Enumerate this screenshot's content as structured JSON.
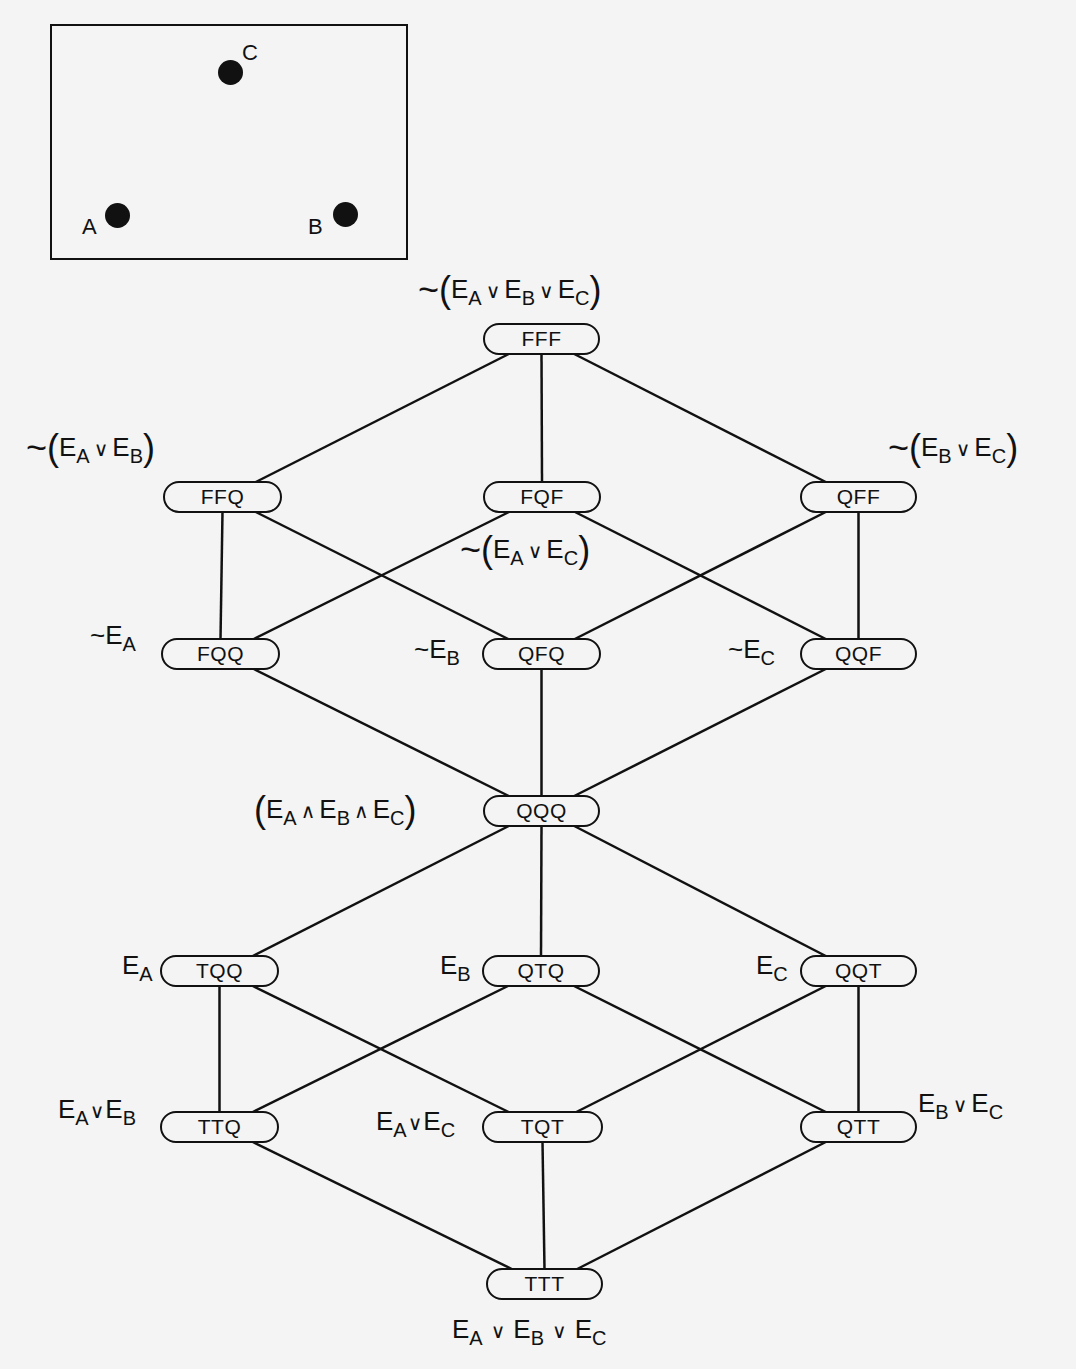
{
  "inset": {
    "points": [
      {
        "name": "A",
        "x": 117,
        "y": 215,
        "label_x": 82,
        "label_y": 214
      },
      {
        "name": "B",
        "x": 345,
        "y": 214,
        "label_x": 308,
        "label_y": 214
      },
      {
        "name": "C",
        "x": 230,
        "y": 72,
        "label_x": 242,
        "label_y": 40
      }
    ]
  },
  "nodes": [
    {
      "id": "FFF",
      "label": "FFF",
      "x": 483,
      "y": 323,
      "w": 117
    },
    {
      "id": "FFQ",
      "label": "FFQ",
      "x": 163,
      "y": 481,
      "w": 119
    },
    {
      "id": "FQF",
      "label": "FQF",
      "x": 483,
      "y": 481,
      "w": 118
    },
    {
      "id": "QFF",
      "label": "QFF",
      "x": 800,
      "y": 481,
      "w": 117
    },
    {
      "id": "FQQ",
      "label": "FQQ",
      "x": 161,
      "y": 638,
      "w": 119
    },
    {
      "id": "QFQ",
      "label": "QFQ",
      "x": 482,
      "y": 638,
      "w": 119
    },
    {
      "id": "QQF",
      "label": "QQF",
      "x": 800,
      "y": 638,
      "w": 117
    },
    {
      "id": "QQQ",
      "label": "QQQ",
      "x": 483,
      "y": 795,
      "w": 117
    },
    {
      "id": "TQQ",
      "label": "TQQ",
      "x": 160,
      "y": 955,
      "w": 119
    },
    {
      "id": "QTQ",
      "label": "QTQ",
      "x": 482,
      "y": 955,
      "w": 118
    },
    {
      "id": "QQT",
      "label": "QQT",
      "x": 800,
      "y": 955,
      "w": 117
    },
    {
      "id": "TTQ",
      "label": "TTQ",
      "x": 160,
      "y": 1111,
      "w": 119
    },
    {
      "id": "TQT",
      "label": "TQT",
      "x": 482,
      "y": 1111,
      "w": 121
    },
    {
      "id": "QTT",
      "label": "QTT",
      "x": 800,
      "y": 1111,
      "w": 117
    },
    {
      "id": "TTT",
      "label": "TTT",
      "x": 486,
      "y": 1268,
      "w": 117
    }
  ],
  "edges": [
    [
      "FFF",
      "FFQ"
    ],
    [
      "FFF",
      "FQF"
    ],
    [
      "FFF",
      "QFF"
    ],
    [
      "FFQ",
      "FQQ"
    ],
    [
      "FFQ",
      "QFQ"
    ],
    [
      "FQF",
      "FQQ"
    ],
    [
      "FQF",
      "QQF"
    ],
    [
      "QFF",
      "QFQ"
    ],
    [
      "QFF",
      "QQF"
    ],
    [
      "FQQ",
      "QQQ"
    ],
    [
      "QFQ",
      "QQQ"
    ],
    [
      "QQF",
      "QQQ"
    ],
    [
      "QQQ",
      "TQQ"
    ],
    [
      "QQQ",
      "QTQ"
    ],
    [
      "QQQ",
      "QQT"
    ],
    [
      "TQQ",
      "TTQ"
    ],
    [
      "TQQ",
      "TQT"
    ],
    [
      "QTQ",
      "TTQ"
    ],
    [
      "QTQ",
      "QTT"
    ],
    [
      "QQT",
      "TQT"
    ],
    [
      "QQT",
      "QTT"
    ],
    [
      "TTQ",
      "TTT"
    ],
    [
      "TQT",
      "TTT"
    ],
    [
      "QTT",
      "TTT"
    ]
  ],
  "labels": {
    "FFF": "~(E_A ∨ E_B ∨ E_C)",
    "FFQ": "~(E_A ∨ E_B)",
    "FQF": "~(E_A ∨ E_C)",
    "QFF": "~(E_B ∨ E_C)",
    "FQQ": "~E_A",
    "QFQ": "~E_B",
    "QQF": "~E_C",
    "QQQ": "(E_A ∧ E_B ∧ E_C)",
    "TQQ": "E_A",
    "QTQ": "E_B",
    "QQT": "E_C",
    "TTQ": "E_A ∨ E_B",
    "TQT": "E_A ∨ E_C",
    "QTT": "E_B ∨ E_C",
    "TTT": "E_A ∨ E_B ∨ E_C"
  },
  "colors": {
    "ink": "#111111",
    "paper": "#f4f4f4"
  }
}
